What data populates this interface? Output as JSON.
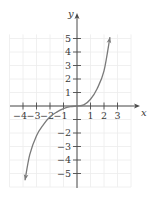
{
  "chart_data": {
    "type": "line",
    "title": "",
    "xlabel": "x",
    "ylabel": "y",
    "xlim": [
      -5,
      4
    ],
    "ylim": [
      -6,
      6
    ],
    "grid": true,
    "legend": null,
    "x_ticks": [
      -4,
      -3,
      -2,
      -1,
      1,
      2,
      3
    ],
    "x_tick_labels": [
      "−4",
      "−3",
      "−2",
      "−1",
      "1",
      "2",
      "3"
    ],
    "y_ticks": [
      5,
      4,
      3,
      2,
      1,
      -2,
      -3,
      -4,
      -5
    ],
    "y_tick_labels": [
      "5",
      "4",
      "3",
      "2",
      "1",
      "−2",
      "−3",
      "−4",
      "−5"
    ],
    "series": [
      {
        "name": "curve",
        "arrows_at_ends": true,
        "x": [
          -3.85,
          -3.5,
          -3.0,
          -2.5,
          -2.0,
          -1.5,
          -1.0,
          -0.5,
          0.0,
          0.5,
          1.0,
          1.5,
          2.0,
          2.44
        ],
        "y": [
          -5.5,
          -3.6,
          -2.2,
          -1.4,
          -0.8,
          -0.45,
          -0.2,
          -0.05,
          0.0,
          0.08,
          0.5,
          1.3,
          2.6,
          5.1
        ]
      }
    ]
  },
  "colors": {
    "axis": "#4a4a4a",
    "grid": "#ececec",
    "curve": "#7a7a7a",
    "text": "#3a3a3a"
  }
}
